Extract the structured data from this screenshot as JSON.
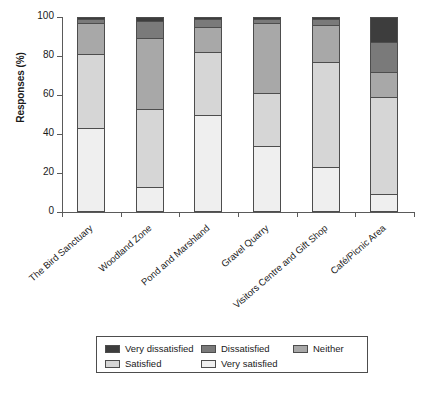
{
  "chart_data": {
    "type": "bar",
    "subtype": "stacked-bar-100",
    "title": "",
    "xlabel": "",
    "ylabel": "Responses (%)",
    "ylim": [
      0,
      100
    ],
    "yticks": [
      0,
      20,
      40,
      60,
      80,
      100
    ],
    "grid": false,
    "legend_position": "bottom",
    "categories": [
      "The Bird Sanctuary",
      "Woodland Zone",
      "Pond and Marshland",
      "Gravel Quarry",
      "Visitors Centre and Gift Shop",
      "Café/Picnic Area"
    ],
    "series": [
      {
        "name": "Very satisfied",
        "color": "#efefef",
        "values": [
          43,
          13,
          50,
          34,
          23,
          9
        ]
      },
      {
        "name": "Satisfied",
        "color": "#d6d6d6",
        "values": [
          38,
          40,
          32,
          27,
          54,
          50
        ]
      },
      {
        "name": "Neither",
        "color": "#a8a8a8",
        "values": [
          16,
          36,
          13,
          36,
          19,
          13
        ]
      },
      {
        "name": "Dissatisfied",
        "color": "#7a7a7a",
        "values": [
          2,
          9,
          4,
          2,
          3,
          15
        ]
      },
      {
        "name": "Very dissatisfied",
        "color": "#3d3d3d",
        "values": [
          1,
          2,
          1,
          1,
          1,
          13
        ]
      }
    ]
  },
  "axis": {
    "y_title": "Responses (%)",
    "y_tick_labels": [
      "0",
      "20",
      "40",
      "60",
      "80",
      "100"
    ]
  },
  "legend": {
    "items": [
      {
        "label": "Very dissatisfied",
        "color": "#3d3d3d"
      },
      {
        "label": "Dissatisfied",
        "color": "#7a7a7a"
      },
      {
        "label": "Neither",
        "color": "#a8a8a8"
      },
      {
        "label": "Satisfied",
        "color": "#d6d6d6"
      },
      {
        "label": "Very satisfied",
        "color": "#efefef"
      }
    ]
  }
}
